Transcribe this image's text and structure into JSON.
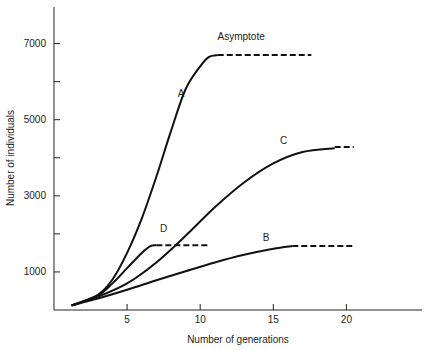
{
  "chart_data": {
    "type": "line",
    "title": "",
    "xlabel": "Number of generations",
    "ylabel": "Number of individuals",
    "xlim": [
      0,
      25
    ],
    "ylim": [
      0,
      8000
    ],
    "xticks": [
      5,
      10,
      15,
      20
    ],
    "yticks_labeled": [
      1000,
      3000,
      5000,
      7000
    ],
    "yticks_minor": [
      2000,
      4000,
      6000
    ],
    "grid": false,
    "legend": "none (curves labeled inline)",
    "annotations": [
      {
        "text": "Asymptote",
        "x": 12.8,
        "y": 7100
      },
      {
        "text": "A",
        "x": 8.7,
        "y": 5600
      },
      {
        "text": "B",
        "x": 14.5,
        "y": 1800
      },
      {
        "text": "C",
        "x": 15.7,
        "y": 4350
      },
      {
        "text": "D",
        "x": 7.5,
        "y": 2050
      }
    ],
    "series": [
      {
        "name": "A",
        "x": [
          1.2,
          3,
          4,
          5,
          6,
          7,
          8,
          9,
          10,
          10.6,
          11.2
        ],
        "y": [
          120,
          400,
          800,
          1500,
          2400,
          3500,
          4700,
          5800,
          6400,
          6650,
          6700
        ],
        "asymptote": {
          "value": 6700,
          "x_from": 11.2,
          "x_to": 17.6,
          "style": "dashed"
        }
      },
      {
        "name": "B",
        "x": [
          1.2,
          3,
          5,
          7,
          9,
          11,
          13,
          15,
          16.3
        ],
        "y": [
          120,
          300,
          530,
          780,
          1020,
          1250,
          1450,
          1610,
          1680
        ],
        "asymptote": {
          "value": 1680,
          "x_from": 16.3,
          "x_to": 20.6,
          "style": "dashed"
        }
      },
      {
        "name": "C",
        "x": [
          1.2,
          3,
          5,
          7,
          9,
          11,
          13,
          15,
          17,
          19.2
        ],
        "y": [
          120,
          350,
          700,
          1250,
          1950,
          2700,
          3350,
          3850,
          4150,
          4250
        ],
        "asymptote": {
          "value": 4280,
          "x_from": 19.2,
          "x_to": 20.5,
          "style": "dashed"
        }
      },
      {
        "name": "D",
        "x": [
          1.2,
          3,
          4,
          5,
          6,
          6.6,
          7
        ],
        "y": [
          120,
          380,
          700,
          1100,
          1500,
          1680,
          1700
        ],
        "asymptote": {
          "value": 1700,
          "x_from": 7,
          "x_to": 10.5,
          "style": "dashed"
        }
      }
    ]
  }
}
